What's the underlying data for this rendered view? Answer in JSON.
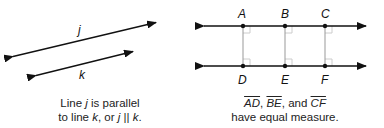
{
  "left_figure": {
    "line_j_label": "j",
    "line_k_label": "k",
    "caption": {
      "line1_pre": "Line ",
      "line1_var": "j",
      "line1_post": " is parallel",
      "line2_pre": "to line ",
      "line2_var_k": "k",
      "line2_mid": ", or ",
      "line2_var_j": "j",
      "line2_sym": " || ",
      "line2_var_k2": "k",
      "line2_end": "."
    }
  },
  "right_figure": {
    "top_points": [
      "A",
      "B",
      "C"
    ],
    "bottom_points": [
      "D",
      "E",
      "F"
    ],
    "caption": {
      "seg1": "AD",
      "sep1": ", ",
      "seg2": "BE",
      "sep2": ", and ",
      "seg3": "CF",
      "line2": "have equal measure."
    }
  },
  "colors": {
    "line": "#111111",
    "perpendicular": "#999999",
    "right_angle_mark": "#cccccc"
  }
}
